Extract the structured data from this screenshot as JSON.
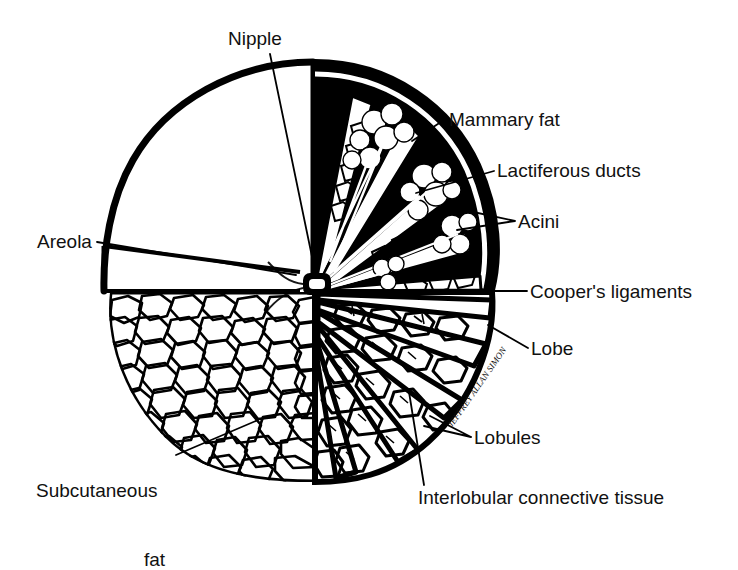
{
  "figure": {
    "kind": "anatomical-line-diagram",
    "background_color": "#ffffff",
    "ink_color": "#000000",
    "signature": "JEFFREY ALLAN SIMON"
  },
  "labels": [
    {
      "id": "nipple",
      "text": "Nipple",
      "x": 228,
      "y": 28,
      "align": "left"
    },
    {
      "id": "mammary-fat",
      "text": "Mammary fat",
      "x": 449,
      "y": 109,
      "align": "left"
    },
    {
      "id": "lactiferous",
      "text": "Lactiferous ducts",
      "x": 497,
      "y": 160,
      "align": "left"
    },
    {
      "id": "acini",
      "text": "Acini",
      "x": 518,
      "y": 211,
      "align": "left"
    },
    {
      "id": "coopers",
      "text": "Cooper's ligaments",
      "x": 530,
      "y": 281,
      "align": "left"
    },
    {
      "id": "lobe",
      "text": "Lobe",
      "x": 531,
      "y": 338,
      "align": "left"
    },
    {
      "id": "lobules",
      "text": "Lobules",
      "x": 474,
      "y": 427,
      "align": "left"
    },
    {
      "id": "areola",
      "text": "Areola",
      "x": 37,
      "y": 231,
      "align": "left"
    },
    {
      "id": "interlobular",
      "text": "Interlobular connective tissue",
      "x": 418,
      "y": 487,
      "align": "left"
    }
  ],
  "labels_multiline": [
    {
      "id": "subcutaneous-fat",
      "line1": "Subcutaneous",
      "line2": "fat",
      "x": 36,
      "y": 433,
      "line2_indent": 108
    }
  ],
  "regions": [
    {
      "id": "skin-sector",
      "name": "skin / upper-left quadrant outline",
      "fill": "none"
    },
    {
      "id": "areola-wedge",
      "name": "areola wedge",
      "fill": "none"
    },
    {
      "id": "subcutaneous-fat",
      "name": "subcutaneous fat, lower-left",
      "fill": "cellular-texture"
    },
    {
      "id": "mammary-gland-lobes",
      "name": "glandular lobes with acini, upper-right",
      "fill": "black"
    },
    {
      "id": "lobe-wedges",
      "name": "lobes and lobules, lower-right",
      "fill": "cellular-texture"
    }
  ]
}
